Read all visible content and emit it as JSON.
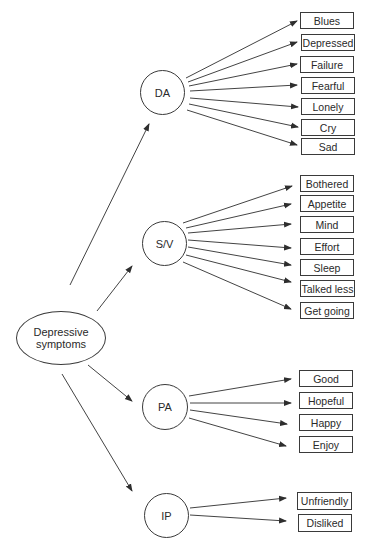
{
  "diagram": {
    "root": {
      "label_line1": "Depressive",
      "label_line2": "symptoms"
    },
    "factors": [
      {
        "id": "DA",
        "label": "DA",
        "items": [
          "Blues",
          "Depressed",
          "Failure",
          "Fearful",
          "Lonely",
          "Cry",
          "Sad"
        ]
      },
      {
        "id": "SV",
        "label": "S/V",
        "items": [
          "Bothered",
          "Appetite",
          "Mind",
          "Effort",
          "Sleep",
          "Talked less",
          "Get going"
        ]
      },
      {
        "id": "PA",
        "label": "PA",
        "items": [
          "Good",
          "Hopeful",
          "Happy",
          "Enjoy"
        ]
      },
      {
        "id": "IP",
        "label": "IP",
        "items": [
          "Unfriendly",
          "Disliked"
        ]
      }
    ],
    "colors": {
      "line": "#2e2e2e",
      "text": "#2a2a2a",
      "background": "#ffffff"
    }
  }
}
